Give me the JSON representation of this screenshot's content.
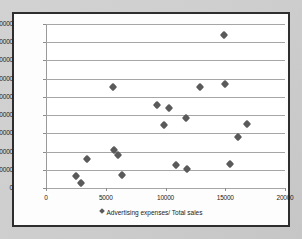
{
  "chart_data": {
    "type": "scatter",
    "title": "",
    "xlabel": "",
    "ylabel": "",
    "xlim": [
      0,
      20000
    ],
    "ylim": [
      0,
      90000
    ],
    "xticks": [
      0,
      5000,
      10000,
      15000,
      20000
    ],
    "yticks": [
      0,
      10000,
      20000,
      30000,
      40000,
      50000,
      60000,
      70000,
      80000,
      90000
    ],
    "grid": "horizontal",
    "legend_position": "bottom",
    "series": [
      {
        "name": "Advertising expenses/ Total sales",
        "marker": "diamond",
        "color": "#5a5a5a",
        "points": [
          [
            2500,
            6600
          ],
          [
            2950,
            2700
          ],
          [
            3400,
            15700
          ],
          [
            5600,
            55700
          ],
          [
            5650,
            21000
          ],
          [
            6050,
            18000
          ],
          [
            6400,
            7100
          ],
          [
            9250,
            45300
          ],
          [
            9900,
            34400
          ],
          [
            10300,
            43800
          ],
          [
            10900,
            12800
          ],
          [
            11700,
            38300
          ],
          [
            11800,
            10200
          ],
          [
            12900,
            55400
          ],
          [
            14900,
            84100
          ],
          [
            14950,
            56800
          ],
          [
            15400,
            13300
          ],
          [
            16100,
            28200
          ],
          [
            16800,
            35200
          ]
        ]
      }
    ]
  },
  "legend": {
    "marker_name": "diamond-marker",
    "label": "Advertising expenses/ Total sales"
  },
  "axis_labels": {
    "y": [
      "90000",
      "80000",
      "70000",
      "60000",
      "50000",
      "40000",
      "30000",
      "20000",
      "10000",
      "0"
    ],
    "x": [
      "0",
      "5000",
      "10000",
      "15000",
      "20000"
    ]
  }
}
